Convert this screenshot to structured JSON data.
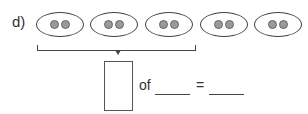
{
  "problem": {
    "label": "d)",
    "groups": [
      {
        "dots": 2
      },
      {
        "dots": 2
      },
      {
        "dots": 2
      },
      {
        "dots": 2
      },
      {
        "dots": 2
      }
    ],
    "bracket_spans_groups": 3,
    "of_text": "of",
    "equals_text": "=",
    "fraction_box": "",
    "blank1": "",
    "blank2": ""
  }
}
